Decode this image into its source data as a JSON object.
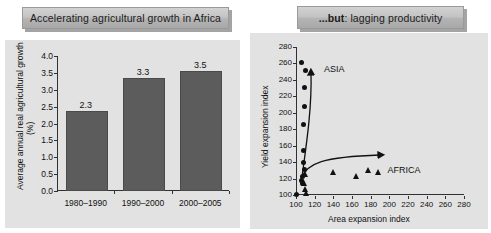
{
  "panels": {
    "left": {
      "banner": "Accelerating agricultural growth in Africa"
    },
    "right": {
      "banner_bold": "...but",
      "banner_rest": ": lagging productivity"
    }
  },
  "chart_data": [
    {
      "type": "bar",
      "title": "Accelerating agricultural growth in Africa",
      "categories": [
        "1980–1990",
        "1990–2000",
        "2000–2005"
      ],
      "values": [
        2.3,
        3.3,
        3.5
      ],
      "data_labels": [
        "2.3",
        "3.3",
        "3.5"
      ],
      "xlabel": "",
      "ylabel": "Average annual real agricultural growth (%)",
      "ylabel_line1": "Average annual real agricultural growth",
      "ylabel_line2": "(%)",
      "ylim": [
        0.0,
        4.0
      ],
      "ytick_labels": [
        "0.0",
        "0.5",
        "1.0",
        "1.5",
        "2.0",
        "2.5",
        "3.0",
        "3.5",
        "4.0"
      ],
      "ytick_values": [
        0.0,
        0.5,
        1.0,
        1.5,
        2.0,
        2.5,
        3.0,
        3.5,
        4.0
      ],
      "grid": false,
      "legend": "none",
      "bar_color": "#5c5c5c",
      "panel_background": "#e2e2e2"
    },
    {
      "type": "scatter",
      "title": "...but: lagging productivity",
      "xlabel": "Area expansion index",
      "ylabel": "Yield expansion index",
      "xlim": [
        100,
        280
      ],
      "ylim": [
        100,
        280
      ],
      "xtick_labels": [
        "100",
        "120",
        "140",
        "160",
        "180",
        "200",
        "220",
        "240",
        "260",
        "280"
      ],
      "xtick_values": [
        100,
        120,
        140,
        160,
        180,
        200,
        220,
        240,
        260,
        280
      ],
      "ytick_labels": [
        "100",
        "120",
        "140",
        "160",
        "180",
        "200",
        "220",
        "240",
        "260",
        "280"
      ],
      "ytick_values": [
        100,
        120,
        140,
        160,
        180,
        200,
        220,
        240,
        260,
        280
      ],
      "grid": false,
      "legend": "none",
      "annotations": [
        {
          "text": "ASIA",
          "x": 130,
          "y": 252
        },
        {
          "text": "AFRICA",
          "x": 198,
          "y": 129
        }
      ],
      "series": [
        {
          "name": "ASIA",
          "marker": "circle",
          "color": "#111111",
          "points": [
            {
              "x": 106,
              "y": 261
            },
            {
              "x": 110,
              "y": 252
            },
            {
              "x": 109,
              "y": 231
            },
            {
              "x": 109,
              "y": 208
            },
            {
              "x": 108,
              "y": 186
            },
            {
              "x": 108,
              "y": 154
            },
            {
              "x": 108,
              "y": 139
            },
            {
              "x": 109,
              "y": 131
            },
            {
              "x": 107,
              "y": 123
            },
            {
              "x": 106,
              "y": 118
            },
            {
              "x": 107,
              "y": 114
            },
            {
              "x": 101,
              "y": 101
            }
          ]
        },
        {
          "name": "AFRICA",
          "marker": "triangle",
          "color": "#111111",
          "points": [
            {
              "x": 110,
              "y": 126
            },
            {
              "x": 109,
              "y": 114
            },
            {
              "x": 110,
              "y": 107
            },
            {
              "x": 111,
              "y": 102
            },
            {
              "x": 140,
              "y": 128
            },
            {
              "x": 165,
              "y": 123
            },
            {
              "x": 178,
              "y": 131
            },
            {
              "x": 188,
              "y": 128
            }
          ]
        }
      ],
      "trend_curves": [
        {
          "name": "asia-trend",
          "direction": "up",
          "arrow": true
        },
        {
          "name": "africa-trend",
          "direction": "right",
          "arrow": true
        }
      ],
      "panel_background": "#e2e2e2"
    }
  ]
}
